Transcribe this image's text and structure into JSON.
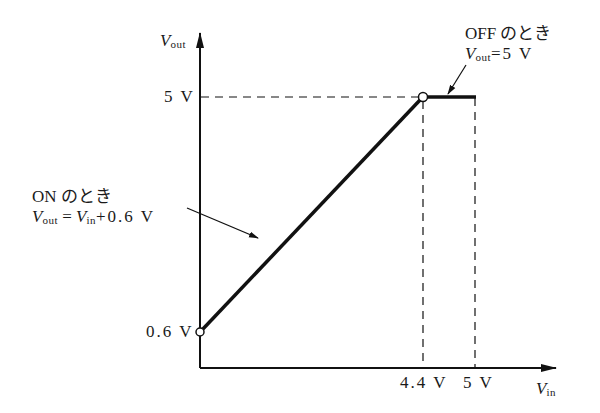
{
  "diagram": {
    "type": "characteristic-graph",
    "axes": {
      "y": {
        "symbol": "V",
        "subscript": "out"
      },
      "x": {
        "symbol": "V",
        "subscript": "in"
      }
    },
    "ticks": {
      "y": [
        "5 V",
        "0.6 V"
      ],
      "x": [
        "4.4 V",
        "5 V"
      ]
    },
    "annotations": {
      "on": {
        "title": "ON のとき",
        "eq_lhs_symbol": "V",
        "eq_lhs_sub": "out",
        "eq_mid": " = ",
        "eq_rhs_symbol": "V",
        "eq_rhs_sub": "in",
        "eq_tail": "+0.6 V"
      },
      "off": {
        "title": "OFF のとき",
        "eq_lhs_symbol": "V",
        "eq_lhs_sub": "out",
        "eq_tail": "=5 V"
      }
    },
    "segments": [
      {
        "name": "on-region",
        "from": [
          0,
          0.6
        ],
        "to": [
          4.4,
          5
        ]
      },
      {
        "name": "off-region",
        "from": [
          4.4,
          5
        ],
        "to": [
          5,
          5
        ]
      }
    ],
    "colors": {
      "line": "#111111",
      "background": "#ffffff"
    }
  }
}
